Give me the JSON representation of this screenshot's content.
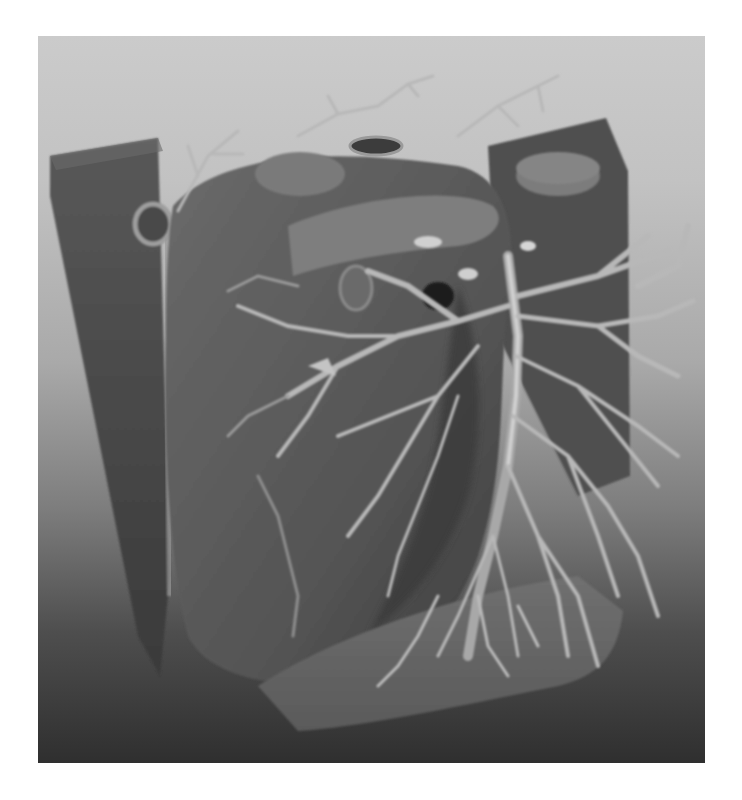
{
  "image": {
    "subject": "3D volume rendering of heart and lungs with bronchial/vascular tree",
    "colormap": "grayscale",
    "background_gradient": {
      "top": "#cbcbcb",
      "bottom": "#2f2f2f"
    },
    "tones": {
      "slab_dark": "#4a4a4a",
      "heart_body": "#5e5e5e",
      "heart_shadow": "#3a3a3a",
      "vessel_light": "#b0b0b0",
      "vessel_highlight": "#d4d4d4",
      "base_plate": "#6e6e6e"
    }
  }
}
